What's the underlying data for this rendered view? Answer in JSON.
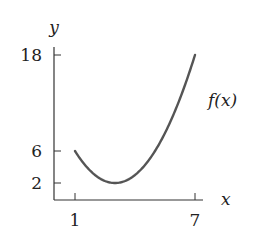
{
  "chart_data": {
    "type": "line",
    "title": "",
    "xlabel": "x",
    "ylabel": "y",
    "function_label": "f(x)",
    "x_ticks": [
      1,
      7
    ],
    "y_ticks": [
      2,
      6,
      18
    ],
    "x_tick_labels": [
      "1",
      "7"
    ],
    "y_tick_labels": [
      "2",
      "6",
      "18"
    ],
    "xlim": [
      0,
      7.4
    ],
    "ylim": [
      0,
      19.5
    ],
    "grid": false,
    "legend": null,
    "series": [
      {
        "name": "f(x)",
        "x": [
          1,
          1.5,
          2,
          2.5,
          3,
          3.5,
          4,
          4.5,
          5,
          5.5,
          6,
          6.5,
          7
        ],
        "values": [
          6,
          4.25,
          3,
          2.25,
          2,
          2.25,
          3,
          4.25,
          6,
          8.25,
          11,
          14.25,
          18
        ],
        "color": "#555555"
      }
    ],
    "annotations": [
      {
        "text": "f(x)",
        "near_x": 7.3,
        "near_y": 11
      }
    ]
  }
}
